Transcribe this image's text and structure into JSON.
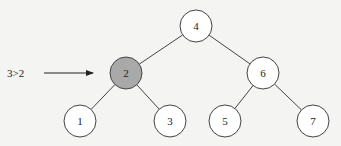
{
  "diagram": {
    "annotation": {
      "text": "3>2",
      "x": 24,
      "y": 73,
      "arrow_from": 44,
      "arrow_to": 93
    },
    "highlight_color": "#a9a9a9",
    "node_fill": "#ffffff",
    "stroke_color": "#444444",
    "nodes": [
      {
        "id": "n4",
        "label": "4",
        "x": 196,
        "y": 26,
        "highlighted": false
      },
      {
        "id": "n2",
        "label": "2",
        "x": 126,
        "y": 73,
        "highlighted": true
      },
      {
        "id": "n6",
        "label": "6",
        "x": 263,
        "y": 73,
        "highlighted": false
      },
      {
        "id": "n1",
        "label": "1",
        "x": 80,
        "y": 121,
        "highlighted": false
      },
      {
        "id": "n3",
        "label": "3",
        "x": 170,
        "y": 121,
        "highlighted": false
      },
      {
        "id": "n5",
        "label": "5",
        "x": 225,
        "y": 121,
        "highlighted": false
      },
      {
        "id": "n7",
        "label": "7",
        "x": 313,
        "y": 121,
        "highlighted": false
      }
    ],
    "edges": [
      [
        "n4",
        "n2"
      ],
      [
        "n4",
        "n6"
      ],
      [
        "n2",
        "n1"
      ],
      [
        "n2",
        "n3"
      ],
      [
        "n6",
        "n5"
      ],
      [
        "n6",
        "n7"
      ]
    ]
  }
}
